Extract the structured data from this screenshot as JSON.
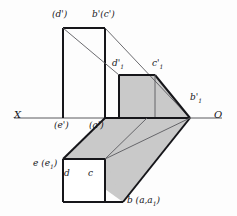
{
  "figure": {
    "type": "descriptive-geometry-projection",
    "title": "",
    "axis": {
      "left_label": "X",
      "right_label": "O",
      "y": 118,
      "x_start": 14,
      "x_end": 222
    },
    "colors": {
      "line": "#16161a",
      "thin_line": "#5a5a5f",
      "fill_gray": "#c9c9c9",
      "fill_white": "#ffffff",
      "background": "#fdfdfd",
      "text": "#16161a"
    },
    "labels": [
      {
        "id": "d-prime-paren",
        "text": "(d')",
        "x": 52,
        "y": 10,
        "name": "label-d-prime-parenthesized"
      },
      {
        "id": "b-prime-c-prime",
        "text": "b'(c')",
        "x": 92,
        "y": 10,
        "name": "label-b-prime-c-prime"
      },
      {
        "id": "d-prime-1",
        "text": "d'",
        "sub": "1",
        "x": 112,
        "y": 59,
        "name": "label-d-prime-1"
      },
      {
        "id": "c-prime-1",
        "text": "c'",
        "sub": "1",
        "x": 152,
        "y": 59,
        "name": "label-c-prime-1"
      },
      {
        "id": "b-prime-1",
        "text": "b'",
        "sub": "1",
        "x": 190,
        "y": 93,
        "name": "label-b-prime-1"
      },
      {
        "id": "e-prime-paren",
        "text": "(e')",
        "x": 54,
        "y": 121,
        "name": "label-e-prime-parenthesized"
      },
      {
        "id": "a-prime-paren",
        "text": "(a')",
        "x": 89,
        "y": 121,
        "name": "label-a-prime-parenthesized"
      },
      {
        "id": "e-e1",
        "text": "e (e",
        "sub": "1",
        "suffix": ")",
        "x": 35,
        "y": 159,
        "name": "label-e-e1"
      },
      {
        "id": "d-plain",
        "text": "d",
        "x": 62,
        "y": 172,
        "name": "label-d"
      },
      {
        "id": "c-plain",
        "text": "c",
        "x": 85,
        "y": 172,
        "name": "label-c"
      },
      {
        "id": "b-a-a1",
        "text": "b (a,a",
        "sub": "1",
        "suffix": ")",
        "x": 128,
        "y": 196,
        "name": "label-b-a-a1"
      }
    ],
    "vertices": {
      "upper_rect_left_top": [
        63,
        28
      ],
      "upper_rect_right_top": [
        105,
        28
      ],
      "upper_rect_left_bottom": [
        63,
        118
      ],
      "upper_rect_right_bottom": [
        105,
        118
      ],
      "d1_prime": [
        119,
        75
      ],
      "c1_prime": [
        155,
        75
      ],
      "b1_prime": [
        190,
        118
      ],
      "top_face_near_left": [
        63,
        159
      ],
      "top_face_near_right": [
        105,
        159
      ],
      "bottom_square_bl": [
        63,
        202
      ],
      "bottom_square_br": [
        105,
        202
      ],
      "prism_far_right": [
        190,
        118
      ]
    }
  }
}
